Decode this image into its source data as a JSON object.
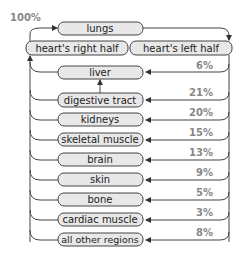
{
  "diagram": {
    "title_percent": "100%",
    "top": {
      "label": "lungs"
    },
    "heart": {
      "right_half": "heart's right half",
      "left_half": "heart's left half"
    },
    "organs": [
      {
        "label": "liver",
        "percent": "6%"
      },
      {
        "label": "digestive tract",
        "percent": "21%"
      },
      {
        "label": "kidneys",
        "percent": "20%"
      },
      {
        "label": "skeletal muscle",
        "percent": "15%"
      },
      {
        "label": "brain",
        "percent": "13%"
      },
      {
        "label": "skin",
        "percent": "9%"
      },
      {
        "label": "bone",
        "percent": "5%"
      },
      {
        "label": "cardiac muscle",
        "percent": "3%"
      },
      {
        "label": "all other regions",
        "percent": "8%"
      }
    ],
    "colors": {
      "pill_fill": "#e8e8e8",
      "stroke": "#444444",
      "percent_text": "#888888"
    }
  }
}
